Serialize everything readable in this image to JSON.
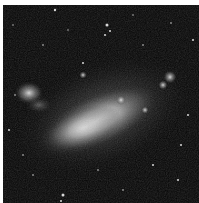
{
  "image": {
    "subject": "galaxy",
    "description": "Grayscale astronomical photograph of an irregular galaxy with a bright elongated bar on a black star field",
    "background_color": "#050505",
    "border_color": "#ffffff"
  }
}
